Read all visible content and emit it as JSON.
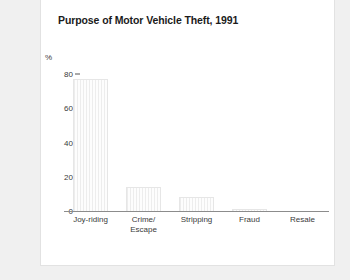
{
  "card": {
    "title": "Purpose of Motor Vehicle Theft, 1991"
  },
  "chart_data": {
    "type": "bar",
    "title": "Purpose of Motor Vehicle Theft, 1991",
    "xlabel": "",
    "ylabel": "%",
    "ylim": [
      0,
      80
    ],
    "yticks": [
      "0",
      "20",
      "40",
      "60",
      "80"
    ],
    "ytick_values": [
      0,
      20,
      40,
      60,
      80
    ],
    "grid": false,
    "legend": "none",
    "categories": [
      "Joy-riding",
      "Crime/\nEscape",
      "Stripping",
      "Fraud",
      "Resale"
    ],
    "category_lines": [
      [
        "Joy-riding"
      ],
      [
        "Crime/",
        "Escape"
      ],
      [
        "Stripping"
      ],
      [
        "Fraud"
      ],
      [
        "Resale"
      ]
    ],
    "values": [
      77,
      14,
      8,
      1,
      0
    ],
    "bar_color": "#fbfbfb",
    "bar_edge_color": "#e6e6e6",
    "axis_color": "#8c8c8c"
  }
}
